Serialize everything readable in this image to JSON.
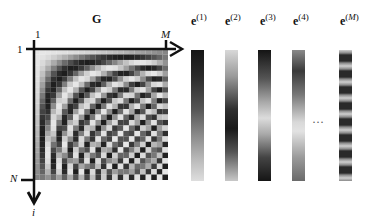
{
  "figure": {
    "matrix": {
      "label": "G",
      "columns": 24,
      "rows": 24,
      "axis_col_start": "1",
      "axis_col_end": "M",
      "axis_row_start": "1",
      "axis_row_end": "N",
      "axis_row_var": "i",
      "colormap": "grayscale"
    },
    "eigenvectors": [
      {
        "base": "e",
        "index": "1",
        "pattern": "dark-top-to-light-bottom"
      },
      {
        "base": "e",
        "index": "2",
        "pattern": "light-dark-light"
      },
      {
        "base": "e",
        "index": "3",
        "pattern": "dark-light-dark"
      },
      {
        "base": "e",
        "index": "4",
        "pattern": "mid-dark-light-dark"
      },
      {
        "base": "e",
        "index": "M",
        "pattern": "alternating-high-frequency"
      }
    ],
    "ellipsis": "···",
    "colors": {
      "background": "#ffffff",
      "ink": "#111111",
      "dark": "#1a1a1a",
      "light": "#e0e0e0"
    }
  }
}
